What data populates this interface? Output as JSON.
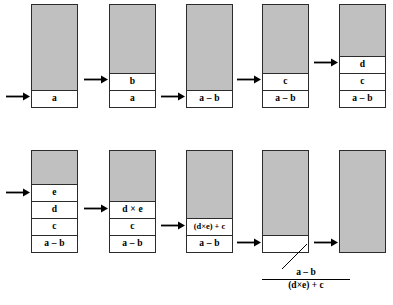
{
  "figure": {
    "colors": {
      "stack_fill_gray": "#c0c0c0",
      "cell_fill_white": "#ffffff",
      "outline": "#2b2b2b",
      "text": "#000000",
      "background": "#ffffff"
    },
    "rows": [
      {
        "row_id": "row-top",
        "stacks": [
          {
            "stack_id": "stack-1",
            "cells": [
              "a"
            ],
            "arrow_target_cell_index": 0
          },
          {
            "stack_id": "stack-2",
            "cells": [
              "a",
              "b"
            ],
            "arrow_target_cell_index": 1
          },
          {
            "stack_id": "stack-3",
            "cells": [
              "a – b"
            ],
            "arrow_target_cell_index": 0
          },
          {
            "stack_id": "stack-4",
            "cells": [
              "a – b",
              "c"
            ],
            "arrow_target_cell_index": 1
          },
          {
            "stack_id": "stack-5",
            "cells": [
              "a – b",
              "c",
              "d"
            ],
            "arrow_target_cell_index": 2
          }
        ]
      },
      {
        "row_id": "row-bottom",
        "stacks": [
          {
            "stack_id": "stack-6",
            "cells": [
              "a – b",
              "c",
              "d",
              "e"
            ],
            "arrow_target_cell_index": 3
          },
          {
            "stack_id": "stack-7",
            "cells": [
              "a – b",
              "c",
              "d × e"
            ],
            "arrow_target_cell_index": 2
          },
          {
            "stack_id": "stack-8",
            "cells": [
              "a – b",
              "(d×e) + c"
            ],
            "arrow_target_cell_index": 1
          },
          {
            "stack_id": "stack-9",
            "cells": [
              ""
            ],
            "arrow_target_cell_index": 0
          },
          {
            "stack_id": "stack-10",
            "cells": [],
            "arrow_target_cell_index": null
          }
        ]
      }
    ],
    "annotation": {
      "numerator": "a – b",
      "denominator": "(d×e) + c"
    }
  }
}
